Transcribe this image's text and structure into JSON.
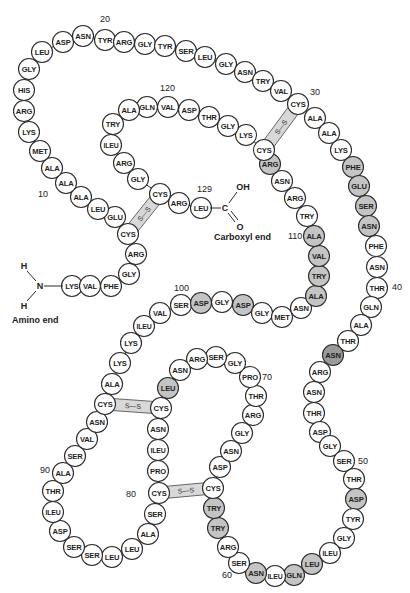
{
  "labels": {
    "amino_end": "Amino end",
    "carboxyl_end": "Carboxyl end",
    "n_atom": "N",
    "h_atom": "H",
    "c_atom": "C",
    "oh_group": "OH",
    "o_atom": "O",
    "disulfide": "S—S"
  },
  "position_numbers": [
    {
      "n": "10",
      "x": 38,
      "y": 197
    },
    {
      "n": "20",
      "x": 100,
      "y": 22
    },
    {
      "n": "30",
      "x": 310,
      "y": 95
    },
    {
      "n": "40",
      "x": 392,
      "y": 290
    },
    {
      "n": "50",
      "x": 358,
      "y": 464
    },
    {
      "n": "60",
      "x": 222,
      "y": 578
    },
    {
      "n": "70",
      "x": 262,
      "y": 380
    },
    {
      "n": "80",
      "x": 126,
      "y": 497
    },
    {
      "n": "90",
      "x": 40,
      "y": 473
    },
    {
      "n": "100",
      "x": 174,
      "y": 291
    },
    {
      "n": "110",
      "x": 288,
      "y": 239
    },
    {
      "n": "120",
      "x": 160,
      "y": 91
    },
    {
      "n": "129",
      "x": 197,
      "y": 192
    }
  ],
  "residues": [
    {
      "i": 1,
      "name": "LYS",
      "x": 72,
      "y": 286,
      "shade": ""
    },
    {
      "i": 2,
      "name": "VAL",
      "x": 90,
      "y": 286,
      "shade": ""
    },
    {
      "i": 3,
      "name": "PHE",
      "x": 111,
      "y": 286,
      "shade": ""
    },
    {
      "i": 4,
      "name": "GLY",
      "x": 129,
      "y": 274,
      "shade": ""
    },
    {
      "i": 5,
      "name": "ARG",
      "x": 136,
      "y": 254,
      "shade": ""
    },
    {
      "i": 6,
      "name": "CYS",
      "x": 128,
      "y": 234,
      "shade": ""
    },
    {
      "i": 7,
      "name": "GLU",
      "x": 115,
      "y": 217,
      "shade": ""
    },
    {
      "i": 8,
      "name": "LEU",
      "x": 98,
      "y": 209,
      "shade": ""
    },
    {
      "i": 9,
      "name": "ALA",
      "x": 81,
      "y": 197,
      "shade": ""
    },
    {
      "i": 10,
      "name": "ALA",
      "x": 66,
      "y": 183,
      "shade": ""
    },
    {
      "i": 11,
      "name": "ALA",
      "x": 52,
      "y": 168,
      "shade": ""
    },
    {
      "i": 12,
      "name": "MET",
      "x": 40,
      "y": 151,
      "shade": ""
    },
    {
      "i": 13,
      "name": "LYS",
      "x": 29,
      "y": 132,
      "shade": ""
    },
    {
      "i": 14,
      "name": "ARG",
      "x": 24,
      "y": 111,
      "shade": ""
    },
    {
      "i": 15,
      "name": "HIS",
      "x": 24,
      "y": 90,
      "shade": ""
    },
    {
      "i": 16,
      "name": "GLY",
      "x": 29,
      "y": 69,
      "shade": ""
    },
    {
      "i": 17,
      "name": "LEU",
      "x": 42,
      "y": 52,
      "shade": ""
    },
    {
      "i": 18,
      "name": "ASP",
      "x": 63,
      "y": 42,
      "shade": ""
    },
    {
      "i": 19,
      "name": "ASN",
      "x": 83,
      "y": 36,
      "shade": ""
    },
    {
      "i": 20,
      "name": "TYR",
      "x": 105,
      "y": 40,
      "shade": ""
    },
    {
      "i": 21,
      "name": "ARG",
      "x": 124,
      "y": 42,
      "shade": ""
    },
    {
      "i": 22,
      "name": "GLY",
      "x": 145,
      "y": 44,
      "shade": ""
    },
    {
      "i": 23,
      "name": "TYR",
      "x": 165,
      "y": 46,
      "shade": ""
    },
    {
      "i": 24,
      "name": "SER",
      "x": 186,
      "y": 51,
      "shade": ""
    },
    {
      "i": 25,
      "name": "LEU",
      "x": 205,
      "y": 57,
      "shade": ""
    },
    {
      "i": 26,
      "name": "GLY",
      "x": 226,
      "y": 64,
      "shade": ""
    },
    {
      "i": 27,
      "name": "ASN",
      "x": 245,
      "y": 72,
      "shade": ""
    },
    {
      "i": 28,
      "name": "TRY",
      "x": 263,
      "y": 81,
      "shade": ""
    },
    {
      "i": 29,
      "name": "VAL",
      "x": 281,
      "y": 91,
      "shade": ""
    },
    {
      "i": 30,
      "name": "CYS",
      "x": 298,
      "y": 104,
      "shade": ""
    },
    {
      "i": 31,
      "name": "ALA",
      "x": 315,
      "y": 118,
      "shade": ""
    },
    {
      "i": 32,
      "name": "ALA",
      "x": 329,
      "y": 133,
      "shade": ""
    },
    {
      "i": 33,
      "name": "LYS",
      "x": 341,
      "y": 150,
      "shade": ""
    },
    {
      "i": 34,
      "name": "PHE",
      "x": 353,
      "y": 167,
      "shade": "shaded"
    },
    {
      "i": 35,
      "name": "GLU",
      "x": 359,
      "y": 186,
      "shade": "shaded"
    },
    {
      "i": 36,
      "name": "SER",
      "x": 366,
      "y": 206,
      "shade": "shaded"
    },
    {
      "i": 37,
      "name": "ASN",
      "x": 369,
      "y": 226,
      "shade": "shaded"
    },
    {
      "i": 38,
      "name": "PHE",
      "x": 376,
      "y": 246,
      "shade": ""
    },
    {
      "i": 39,
      "name": "ASN",
      "x": 377,
      "y": 267,
      "shade": ""
    },
    {
      "i": 40,
      "name": "THR",
      "x": 377,
      "y": 288,
      "shade": ""
    },
    {
      "i": 41,
      "name": "GLN",
      "x": 371,
      "y": 307,
      "shade": ""
    },
    {
      "i": 42,
      "name": "ALA",
      "x": 361,
      "y": 325,
      "shade": ""
    },
    {
      "i": 43,
      "name": "THR",
      "x": 348,
      "y": 341,
      "shade": ""
    },
    {
      "i": 44,
      "name": "ASN",
      "x": 333,
      "y": 355,
      "shade": "dark"
    },
    {
      "i": 45,
      "name": "ARG",
      "x": 320,
      "y": 372,
      "shade": ""
    },
    {
      "i": 46,
      "name": "ASN",
      "x": 314,
      "y": 392,
      "shade": ""
    },
    {
      "i": 47,
      "name": "THR",
      "x": 314,
      "y": 413,
      "shade": ""
    },
    {
      "i": 48,
      "name": "ASP",
      "x": 320,
      "y": 432,
      "shade": ""
    },
    {
      "i": 49,
      "name": "GLY",
      "x": 330,
      "y": 446,
      "shade": ""
    },
    {
      "i": 50,
      "name": "SER",
      "x": 344,
      "y": 461,
      "shade": ""
    },
    {
      "i": 51,
      "name": "THR",
      "x": 354,
      "y": 479,
      "shade": ""
    },
    {
      "i": 52,
      "name": "ASP",
      "x": 356,
      "y": 499,
      "shade": "shaded"
    },
    {
      "i": 53,
      "name": "TYR",
      "x": 353,
      "y": 519,
      "shade": ""
    },
    {
      "i": 54,
      "name": "GLY",
      "x": 344,
      "y": 538,
      "shade": ""
    },
    {
      "i": 55,
      "name": "ILEU",
      "x": 330,
      "y": 553,
      "shade": ""
    },
    {
      "i": 56,
      "name": "LEU",
      "x": 312,
      "y": 564,
      "shade": "shaded"
    },
    {
      "i": 57,
      "name": "GLN",
      "x": 294,
      "y": 575,
      "shade": "shaded"
    },
    {
      "i": 58,
      "name": "ILEU",
      "x": 275,
      "y": 576,
      "shade": ""
    },
    {
      "i": 59,
      "name": "ASN",
      "x": 256,
      "y": 573,
      "shade": "shaded"
    },
    {
      "i": 60,
      "name": "SER",
      "x": 239,
      "y": 563,
      "shade": ""
    },
    {
      "i": 61,
      "name": "ARG",
      "x": 228,
      "y": 547,
      "shade": ""
    },
    {
      "i": 62,
      "name": "TRY",
      "x": 218,
      "y": 528,
      "shade": "shaded"
    },
    {
      "i": 63,
      "name": "TRY",
      "x": 214,
      "y": 508,
      "shade": "shaded"
    },
    {
      "i": 64,
      "name": "CYS",
      "x": 213,
      "y": 488,
      "shade": ""
    },
    {
      "i": 65,
      "name": "ASP",
      "x": 220,
      "y": 467,
      "shade": ""
    },
    {
      "i": 66,
      "name": "ASN",
      "x": 231,
      "y": 451,
      "shade": ""
    },
    {
      "i": 67,
      "name": "GLY",
      "x": 242,
      "y": 433,
      "shade": ""
    },
    {
      "i": 68,
      "name": "ARG",
      "x": 253,
      "y": 415,
      "shade": ""
    },
    {
      "i": 69,
      "name": "THR",
      "x": 256,
      "y": 396,
      "shade": ""
    },
    {
      "i": 70,
      "name": "PRO",
      "x": 250,
      "y": 377,
      "shade": ""
    },
    {
      "i": 71,
      "name": "GLY",
      "x": 235,
      "y": 363,
      "shade": ""
    },
    {
      "i": 72,
      "name": "SER",
      "x": 216,
      "y": 357,
      "shade": ""
    },
    {
      "i": 73,
      "name": "ARG",
      "x": 197,
      "y": 359,
      "shade": ""
    },
    {
      "i": 74,
      "name": "ASN",
      "x": 180,
      "y": 370,
      "shade": ""
    },
    {
      "i": 75,
      "name": "LEU",
      "x": 168,
      "y": 388,
      "shade": "shaded"
    },
    {
      "i": 76,
      "name": "CYS",
      "x": 161,
      "y": 408,
      "shade": ""
    },
    {
      "i": 77,
      "name": "ASN",
      "x": 158,
      "y": 429,
      "shade": ""
    },
    {
      "i": 78,
      "name": "ILEU",
      "x": 158,
      "y": 450,
      "shade": ""
    },
    {
      "i": 79,
      "name": "PRO",
      "x": 158,
      "y": 471,
      "shade": ""
    },
    {
      "i": 80,
      "name": "CYS",
      "x": 159,
      "y": 493,
      "shade": ""
    },
    {
      "i": 81,
      "name": "SER",
      "x": 155,
      "y": 514,
      "shade": ""
    },
    {
      "i": 82,
      "name": "ALA",
      "x": 148,
      "y": 534,
      "shade": ""
    },
    {
      "i": 83,
      "name": "LEU",
      "x": 132,
      "y": 549,
      "shade": ""
    },
    {
      "i": 84,
      "name": "LEU",
      "x": 112,
      "y": 557,
      "shade": ""
    },
    {
      "i": 85,
      "name": "SER",
      "x": 92,
      "y": 555,
      "shade": ""
    },
    {
      "i": 86,
      "name": "SER",
      "x": 74,
      "y": 547,
      "shade": ""
    },
    {
      "i": 87,
      "name": "ASP",
      "x": 60,
      "y": 531,
      "shade": ""
    },
    {
      "i": 88,
      "name": "ILEU",
      "x": 53,
      "y": 512,
      "shade": ""
    },
    {
      "i": 89,
      "name": "THR",
      "x": 53,
      "y": 491,
      "shade": ""
    },
    {
      "i": 90,
      "name": "ALA",
      "x": 63,
      "y": 473,
      "shade": ""
    },
    {
      "i": 91,
      "name": "SER",
      "x": 75,
      "y": 456,
      "shade": ""
    },
    {
      "i": 92,
      "name": "VAL",
      "x": 87,
      "y": 439,
      "shade": ""
    },
    {
      "i": 93,
      "name": "ASN",
      "x": 97,
      "y": 422,
      "shade": ""
    },
    {
      "i": 94,
      "name": "CYS",
      "x": 105,
      "y": 404,
      "shade": ""
    },
    {
      "i": 95,
      "name": "ALA",
      "x": 112,
      "y": 384,
      "shade": ""
    },
    {
      "i": 96,
      "name": "LYS",
      "x": 120,
      "y": 363,
      "shade": ""
    },
    {
      "i": 97,
      "name": "LYS",
      "x": 131,
      "y": 343,
      "shade": ""
    },
    {
      "i": 98,
      "name": "ILEU",
      "x": 144,
      "y": 326,
      "shade": ""
    },
    {
      "i": 99,
      "name": "VAL",
      "x": 160,
      "y": 313,
      "shade": ""
    },
    {
      "i": 100,
      "name": "SER",
      "x": 181,
      "y": 305,
      "shade": ""
    },
    {
      "i": 101,
      "name": "ASP",
      "x": 201,
      "y": 303,
      "shade": "shaded"
    },
    {
      "i": 102,
      "name": "GLY",
      "x": 222,
      "y": 302,
      "shade": ""
    },
    {
      "i": 103,
      "name": "ASP",
      "x": 243,
      "y": 305,
      "shade": "shaded"
    },
    {
      "i": 104,
      "name": "GLY",
      "x": 262,
      "y": 313,
      "shade": ""
    },
    {
      "i": 105,
      "name": "MET",
      "x": 282,
      "y": 317,
      "shade": ""
    },
    {
      "i": 106,
      "name": "ASN",
      "x": 301,
      "y": 308,
      "shade": ""
    },
    {
      "i": 107,
      "name": "ALA",
      "x": 316,
      "y": 296,
      "shade": "shaded"
    },
    {
      "i": 108,
      "name": "TRY",
      "x": 319,
      "y": 276,
      "shade": "shaded"
    },
    {
      "i": 109,
      "name": "VAL",
      "x": 319,
      "y": 256,
      "shade": "shaded"
    },
    {
      "i": 110,
      "name": "ALA",
      "x": 314,
      "y": 236,
      "shade": "shaded"
    },
    {
      "i": 111,
      "name": "TRY",
      "x": 307,
      "y": 216,
      "shade": ""
    },
    {
      "i": 112,
      "name": "ARG",
      "x": 295,
      "y": 198,
      "shade": ""
    },
    {
      "i": 113,
      "name": "ASN",
      "x": 282,
      "y": 181,
      "shade": ""
    },
    {
      "i": 114,
      "name": "ARG",
      "x": 270,
      "y": 164,
      "shade": "shaded"
    },
    {
      "i": 115,
      "name": "CYS",
      "x": 264,
      "y": 150,
      "shade": ""
    },
    {
      "i": 116,
      "name": "LYS",
      "x": 246,
      "y": 135,
      "shade": ""
    },
    {
      "i": 117,
      "name": "GLY",
      "x": 228,
      "y": 126,
      "shade": ""
    },
    {
      "i": 118,
      "name": "THR",
      "x": 209,
      "y": 117,
      "shade": ""
    },
    {
      "i": 119,
      "name": "ASP",
      "x": 189,
      "y": 110,
      "shade": ""
    },
    {
      "i": 120,
      "name": "VAL",
      "x": 168,
      "y": 107,
      "shade": ""
    },
    {
      "i": 121,
      "name": "GLN",
      "x": 147,
      "y": 107,
      "shade": ""
    },
    {
      "i": 122,
      "name": "ALA",
      "x": 129,
      "y": 110,
      "shade": ""
    },
    {
      "i": 123,
      "name": "TRY",
      "x": 113,
      "y": 124,
      "shade": ""
    },
    {
      "i": 124,
      "name": "ILEU",
      "x": 111,
      "y": 145,
      "shade": ""
    },
    {
      "i": 125,
      "name": "ARG",
      "x": 124,
      "y": 163,
      "shade": ""
    },
    {
      "i": 126,
      "name": "GLY",
      "x": 138,
      "y": 179,
      "shade": ""
    },
    {
      "i": 127,
      "name": "CYS",
      "x": 160,
      "y": 194,
      "shade": ""
    },
    {
      "i": 128,
      "name": "ARG",
      "x": 179,
      "y": 203,
      "shade": ""
    },
    {
      "i": 129,
      "name": "LEU",
      "x": 201,
      "y": 208,
      "shade": ""
    }
  ],
  "disulfide_bridges": [
    {
      "from": 6,
      "to": 127
    },
    {
      "from": 30,
      "to": 115
    },
    {
      "from": 64,
      "to": 80
    },
    {
      "from": 76,
      "to": 94
    }
  ]
}
